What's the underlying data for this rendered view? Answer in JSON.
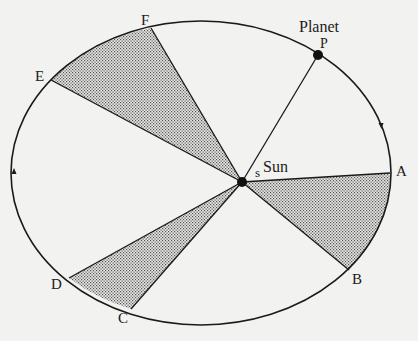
{
  "diagram": {
    "colors": {
      "line": "#1a1a1a",
      "background": "#f2f2f0",
      "shade": "#9a9a9a"
    },
    "orbit": {
      "cx": 201,
      "cy": 173,
      "rx": 190,
      "ry": 152
    },
    "sun": {
      "x": 242,
      "y": 182,
      "label": "Sun",
      "focus_label": "s"
    },
    "planet": {
      "x": 318,
      "y": 55,
      "label": "Planet",
      "point_label": "P"
    },
    "points": [
      {
        "id": "A",
        "label": "A",
        "x": 390,
        "y": 173,
        "lx": 396,
        "ly": 176
      },
      {
        "id": "B",
        "label": "B",
        "x": 349,
        "y": 270,
        "lx": 352,
        "ly": 284
      },
      {
        "id": "C",
        "label": "C",
        "x": 131,
        "y": 309,
        "lx": 118,
        "ly": 323
      },
      {
        "id": "D",
        "label": "D",
        "x": 69,
        "y": 278,
        "lx": 51,
        "ly": 289
      },
      {
        "id": "E",
        "label": "E",
        "x": 51,
        "y": 80,
        "lx": 35,
        "ly": 81
      },
      {
        "id": "F",
        "label": "F",
        "x": 151,
        "y": 28,
        "lx": 141,
        "ly": 25
      }
    ],
    "sectors": [
      {
        "name": "sector-AB",
        "from": "A",
        "to": "B"
      },
      {
        "name": "sector-CD",
        "from": "C",
        "to": "D"
      },
      {
        "name": "sector-EF",
        "from": "E",
        "to": "F"
      }
    ],
    "arrows": [
      {
        "name": "direction-arrow-right",
        "x": 381,
        "y": 126,
        "dir": "down"
      },
      {
        "name": "direction-arrow-left",
        "x": 14,
        "y": 171,
        "dir": "up"
      }
    ]
  }
}
